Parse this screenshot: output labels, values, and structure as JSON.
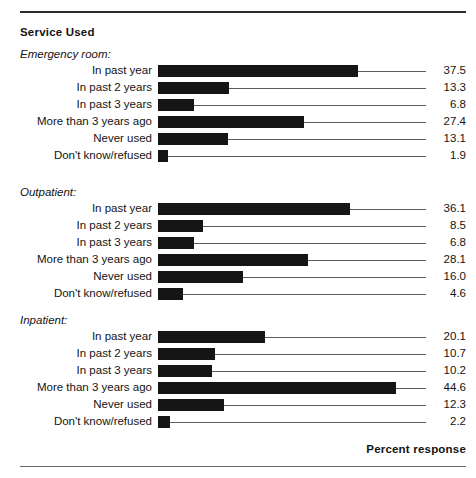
{
  "chart_data": {
    "type": "bar",
    "orientation": "horizontal",
    "title": "Service Used",
    "xlabel": "Percent response",
    "ylabel": "",
    "xlim": [
      0,
      50
    ],
    "grid": false,
    "legend": null,
    "value_labels": true,
    "groups": [
      {
        "name": "Emergency room:",
        "categories": [
          "In past year",
          "In past 2 years",
          "In past 3 years",
          "More than 3 years ago",
          "Never used",
          "Don't know/refused"
        ],
        "values": [
          37.5,
          13.3,
          6.8,
          27.4,
          13.1,
          1.9
        ]
      },
      {
        "name": "Outpatient:",
        "categories": [
          "In past year",
          "In past 2 years",
          "In past 3 years",
          "More than 3 years ago",
          "Never used",
          "Don't know/refused"
        ],
        "values": [
          36.1,
          8.5,
          6.8,
          28.1,
          16.0,
          4.6
        ]
      },
      {
        "name": "Inpatient:",
        "categories": [
          "In past year",
          "In past 2 years",
          "In past 3 years",
          "More than 3 years ago",
          "Never used",
          "Don't know/refused"
        ],
        "values": [
          20.1,
          10.7,
          10.2,
          44.6,
          12.3,
          2.2
        ]
      }
    ]
  },
  "figure": {
    "title": "Service Used",
    "axis_title": "Percent response",
    "bar_color": "#151515",
    "leader_color": "#5c5c5c",
    "rule_color": "#2a2a2a"
  },
  "groups": [
    {
      "label": "Emergency room:",
      "rows": [
        {
          "label": "In past year",
          "value": "37.5"
        },
        {
          "label": "In past 2 years",
          "value": "13.3"
        },
        {
          "label": "In past 3 years",
          "value": "6.8"
        },
        {
          "label": "More than 3 years ago",
          "value": "27.4"
        },
        {
          "label": "Never used",
          "value": "13.1"
        },
        {
          "label": "Don't know/refused",
          "value": "1.9"
        }
      ]
    },
    {
      "label": "Outpatient:",
      "rows": [
        {
          "label": "In past year",
          "value": "36.1"
        },
        {
          "label": "In past 2 years",
          "value": "8.5"
        },
        {
          "label": "In past 3 years",
          "value": "6.8"
        },
        {
          "label": "More than 3 years ago",
          "value": "28.1"
        },
        {
          "label": "Never used",
          "value": "16.0"
        },
        {
          "label": "Don't know/refused",
          "value": "4.6"
        }
      ]
    },
    {
      "label": "Inpatient:",
      "rows": [
        {
          "label": "In past year",
          "value": "20.1"
        },
        {
          "label": "In past 2 years",
          "value": "10.7"
        },
        {
          "label": "In past 3 years",
          "value": "10.2"
        },
        {
          "label": "More than 3 years ago",
          "value": "44.6"
        },
        {
          "label": "Never used",
          "value": "12.3"
        },
        {
          "label": "Don't know/refused",
          "value": "2.2"
        }
      ]
    }
  ]
}
